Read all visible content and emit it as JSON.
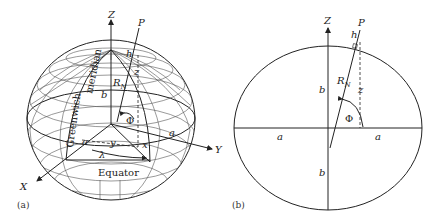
{
  "figure": {
    "panel_a": {
      "caption": "(a)",
      "labels": {
        "z_axis": "Z",
        "x_axis": "X",
        "y_axis": "Y",
        "point": "P",
        "height": "h",
        "rn": "R",
        "rn_sub": "N",
        "z": "z",
        "b": "b",
        "a_left": "a",
        "a_right": "a",
        "y": "y",
        "x": "x",
        "phi": "Φ",
        "lambda": "λ",
        "meridian": "meridian",
        "greenwich": "Greenwich",
        "equator": "Equator"
      }
    },
    "panel_b": {
      "caption": "(b)",
      "labels": {
        "z_axis": "Z",
        "point": "P",
        "height": "h",
        "rn": "R",
        "rn_sub": "N",
        "z": "z",
        "b_top": "b",
        "b_bottom": "b",
        "a_left": "a",
        "a_right": "a",
        "phi": "Φ"
      }
    }
  }
}
